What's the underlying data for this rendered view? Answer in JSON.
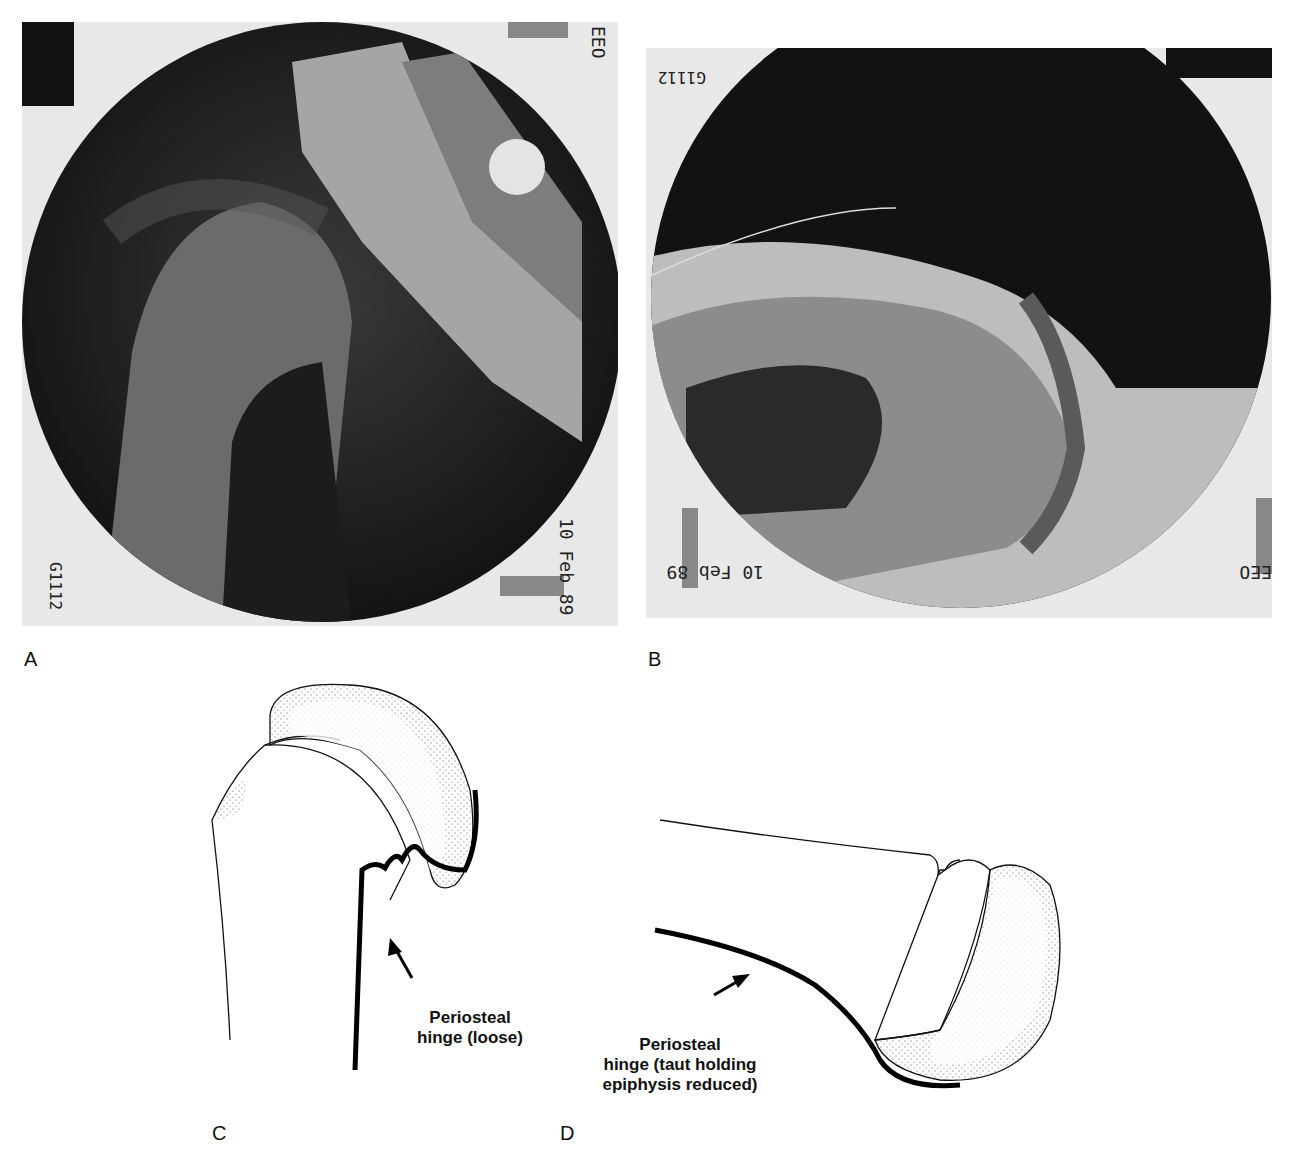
{
  "panels": {
    "a": {
      "letter": "A",
      "film_date": "10 Feb 89",
      "film_marker": "EEO",
      "film_handwriting": "G1112"
    },
    "b": {
      "letter": "B",
      "film_date": "10 Feb 89",
      "film_marker": "EEO",
      "film_handwriting": "G1112"
    },
    "c": {
      "letter": "C",
      "label_line1": "Periosteal",
      "label_line2": "hinge (loose)"
    },
    "d": {
      "letter": "D",
      "label_line1": "Periosteal",
      "label_line2": "hinge (taut holding",
      "label_line3": "epiphysis reduced)"
    }
  }
}
